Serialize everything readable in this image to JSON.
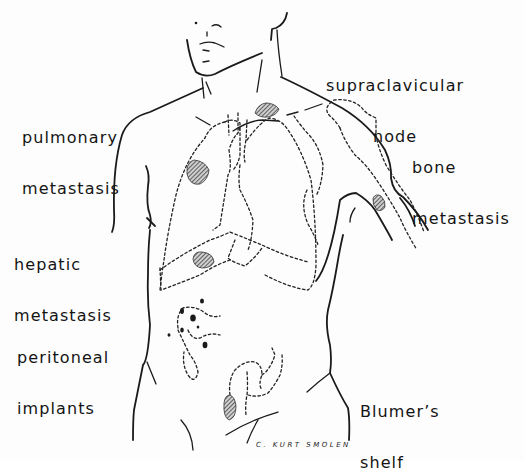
{
  "diagram": {
    "labels": {
      "supraclavicular": [
        "supraclavicular",
        "node"
      ],
      "pulmonary": [
        "pulmonary",
        "metastasis"
      ],
      "bone": [
        "bone",
        "metastasis"
      ],
      "hepatic": [
        "hepatic",
        "metastasis"
      ],
      "peritoneal": [
        "peritoneal",
        "implants"
      ],
      "blumers": [
        "Blumer’s",
        "shelf"
      ]
    },
    "signature": "C. KURT SMOLEN",
    "colors": {
      "background": "#fdfdfd",
      "ink": "#1a1a1a"
    }
  }
}
